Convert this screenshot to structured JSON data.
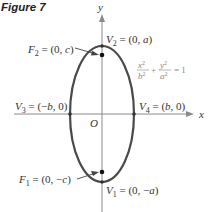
{
  "figure": {
    "title": "Figure 7"
  },
  "axes": {
    "x_label": "x",
    "y_label": "y",
    "origin_label": "O"
  },
  "equation": {
    "x_num": "x",
    "x_exp": "2",
    "x_den": "b",
    "x_den_exp": "2",
    "plus": "+",
    "y_num": "y",
    "y_exp": "2",
    "y_den": "a",
    "y_den_exp": "2",
    "equals": "= 1"
  },
  "points": {
    "f2": {
      "name": "F",
      "sub": "2",
      "coords": " = (0, ",
      "var": "c",
      "close": ")"
    },
    "f1": {
      "name": "F",
      "sub": "1",
      "coords": " = (0, −",
      "var": "c",
      "close": ")"
    },
    "v2": {
      "name": "V",
      "sub": "2",
      "coords": " = (0, ",
      "var": "a",
      "close": ")"
    },
    "v1": {
      "name": "V",
      "sub": "1",
      "coords": " = (0, −",
      "var": "a",
      "close": ")"
    },
    "v3": {
      "name": "V",
      "sub": "3",
      "coords": " = (−",
      "var": "b",
      "close": ", 0)"
    },
    "v4": {
      "name": "V",
      "sub": "4",
      "coords": " = (",
      "var": "b",
      "close": ", 0)"
    }
  },
  "colors": {
    "ellipse": "#444444",
    "axes": "#888888",
    "text": "#333333",
    "equation": "#888888"
  }
}
